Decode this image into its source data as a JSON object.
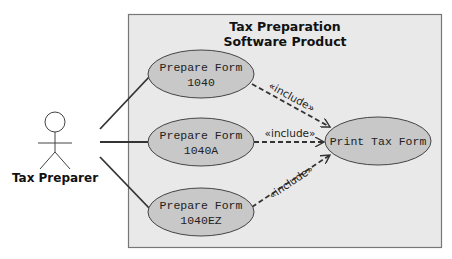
{
  "diagram": {
    "type": "uml-use-case",
    "system_boundary": {
      "title_line1": "Tax Preparation",
      "title_line2": "Software Product",
      "fill": "#e9e9e9",
      "stroke": "#777777"
    },
    "actor": {
      "label": "Tax Preparer"
    },
    "use_cases": [
      {
        "id": "uc1",
        "line1": "Prepare Form",
        "line2": "1040"
      },
      {
        "id": "uc2",
        "line1": "Prepare Form",
        "line2": "1040A"
      },
      {
        "id": "uc3",
        "line1": "Prepare Form",
        "line2": "1040EZ"
      },
      {
        "id": "uc4",
        "line1": "Print Tax Form"
      }
    ],
    "relationships": [
      {
        "from": "actor",
        "to": "uc1",
        "kind": "association"
      },
      {
        "from": "actor",
        "to": "uc2",
        "kind": "association"
      },
      {
        "from": "actor",
        "to": "uc3",
        "kind": "association"
      },
      {
        "from": "uc1",
        "to": "uc4",
        "kind": "include",
        "label": "«include»"
      },
      {
        "from": "uc2",
        "to": "uc4",
        "kind": "include",
        "label": "«include»"
      },
      {
        "from": "uc3",
        "to": "uc4",
        "kind": "include",
        "label": "«include»"
      }
    ],
    "colors": {
      "use_case_fill": "#c8c8c8",
      "line": "#333333"
    }
  }
}
